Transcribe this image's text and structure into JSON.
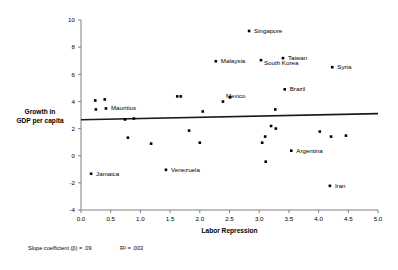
{
  "chart_data": {
    "type": "scatter",
    "title": "",
    "xlabel": "Labor Repression",
    "ylabel": "Growth in GDP per capita",
    "ylabel_line1": "Growth in",
    "ylabel_line2": "GDP per capita",
    "xlim": [
      0.0,
      5.0
    ],
    "ylim": [
      -4,
      10
    ],
    "xticks": [
      "0.0",
      "0.5",
      "1.0",
      "1.5",
      "2.0",
      "2.5",
      "3.0",
      "3.5",
      "4.0",
      "4.5",
      "5.0"
    ],
    "xtick_values": [
      0.0,
      0.5,
      1.0,
      1.5,
      2.0,
      2.5,
      3.0,
      3.5,
      4.0,
      4.5,
      5.0
    ],
    "yticks": [
      "10",
      "8",
      "6",
      "4",
      "2",
      "0",
      "-2",
      "-4"
    ],
    "ytick_values": [
      10,
      8,
      6,
      4,
      2,
      0,
      -2,
      -4
    ],
    "grid": false,
    "legend": "none",
    "trendline": {
      "x0": 0.0,
      "y0": 2.65,
      "x1": 5.0,
      "y1": 3.1,
      "slope": 0.09
    },
    "annotations": [
      {
        "text": "Slope coefficient (β) = .09",
        "x": 0.0,
        "y": -6.4
      },
      {
        "text": "R² = .003",
        "x": 1.5,
        "y": -6.4
      }
    ],
    "points": [
      {
        "label": "",
        "x": 0.24,
        "y": 4.07
      },
      {
        "label": "",
        "x": 0.4,
        "y": 4.15
      },
      {
        "label": "",
        "x": 0.25,
        "y": 3.41
      },
      {
        "label": "Mauritius",
        "x": 0.42,
        "y": 3.48,
        "label_dx": 5,
        "label_dy": 2
      },
      {
        "label": "",
        "x": 0.17,
        "y": -1.33
      },
      {
        "label": "Jamaica",
        "x": 0.17,
        "y": -1.33,
        "label_dx": 5,
        "label_dy": 2,
        "label_only": true
      },
      {
        "label": "",
        "x": 0.74,
        "y": 2.67
      },
      {
        "label": "",
        "x": 0.89,
        "y": 2.74
      },
      {
        "label": "",
        "x": 0.79,
        "y": 1.33
      },
      {
        "label": "",
        "x": 1.18,
        "y": 0.89
      },
      {
        "label": "Venezuela",
        "x": 1.43,
        "y": -1.04,
        "label_dx": 5,
        "label_dy": 2
      },
      {
        "label": "",
        "x": 1.62,
        "y": 4.37
      },
      {
        "label": "",
        "x": 1.68,
        "y": 4.37
      },
      {
        "label": "",
        "x": 1.82,
        "y": 1.85
      },
      {
        "label": "",
        "x": 2.0,
        "y": 0.96
      },
      {
        "label": "",
        "x": 2.05,
        "y": 3.26
      },
      {
        "label": "Mexico",
        "x": 2.39,
        "y": 3.99,
        "label_dx": 3,
        "label_dy": -3.5
      },
      {
        "label": "",
        "x": 2.51,
        "y": 4.3
      },
      {
        "label": "Malaysia",
        "x": 2.27,
        "y": 6.96,
        "label_dx": 5,
        "label_dy": 2
      },
      {
        "label": "Singapore",
        "x": 2.83,
        "y": 9.19,
        "label_dx": 5,
        "label_dy": 2
      },
      {
        "label": "South Korea",
        "x": 3.03,
        "y": 7.04,
        "label_dx": 3,
        "label_dy": 5
      },
      {
        "label": "Taiwan",
        "x": 3.4,
        "y": 7.19,
        "label_dx": 5,
        "label_dy": 2
      },
      {
        "label": "Brazil",
        "x": 3.43,
        "y": 4.89,
        "label_dx": 5,
        "label_dy": 2
      },
      {
        "label": "Syria",
        "x": 4.23,
        "y": 6.52,
        "label_dx": 5,
        "label_dy": 2
      },
      {
        "label": "",
        "x": 3.27,
        "y": 3.41
      },
      {
        "label": "",
        "x": 3.28,
        "y": 2.0
      },
      {
        "label": "",
        "x": 3.1,
        "y": 1.41
      },
      {
        "label": "",
        "x": 3.05,
        "y": 0.96
      },
      {
        "label": "",
        "x": 4.21,
        "y": 1.41
      },
      {
        "label": "",
        "x": 4.46,
        "y": 1.48
      },
      {
        "label": "Argentina",
        "x": 3.54,
        "y": 0.37,
        "label_dx": 5,
        "label_dy": 2
      },
      {
        "label": "",
        "x": 3.11,
        "y": -0.44
      },
      {
        "label": "Iran",
        "x": 4.19,
        "y": -2.22,
        "label_dx": 5,
        "label_dy": 2
      },
      {
        "label": "",
        "x": 3.2,
        "y": 2.19
      },
      {
        "label": "",
        "x": 4.02,
        "y": 1.78
      }
    ]
  },
  "footnote": {
    "slope_text": "Slope coefficient (β) = .09",
    "r2_text": "R² = .003"
  }
}
